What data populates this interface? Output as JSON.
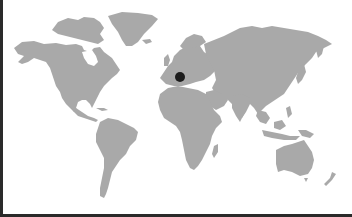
{
  "map": {
    "type": "world-map",
    "land_color": "#a9a9a9",
    "background_color": "#ffffff",
    "frame_color": "#2a2a2a",
    "markers": [
      {
        "name": "location-marker",
        "region": "Europe",
        "x": 180,
        "y": 77,
        "radius": 5,
        "color": "#1c1c1c"
      }
    ]
  }
}
